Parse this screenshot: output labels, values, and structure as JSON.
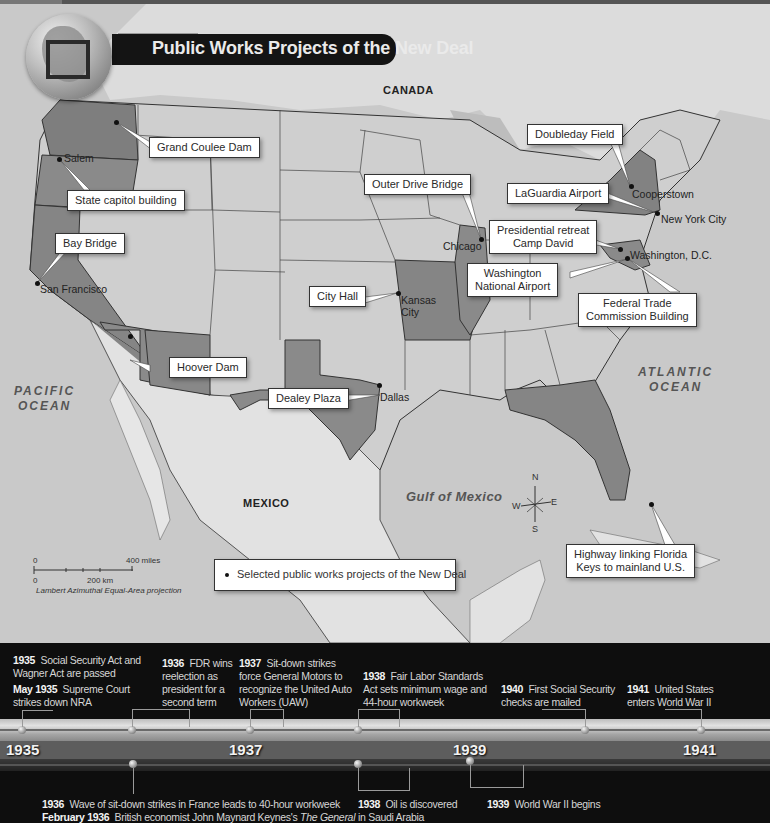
{
  "title": "Public Works Projects of the New Deal",
  "regions": {
    "canada": "CANADA",
    "mexico": "MEXICO",
    "pacific_ocean": [
      "PACIFIC",
      "OCEAN"
    ],
    "atlantic_ocean": [
      "ATLANTIC",
      "OCEAN"
    ],
    "gulf": "Gulf of Mexico"
  },
  "cities": [
    {
      "name": "Salem",
      "x": 40,
      "y": 157
    },
    {
      "name": "San Francisco",
      "x": 37,
      "y": 282
    },
    {
      "name": "Chicago",
      "x": 474,
      "y": 239
    },
    {
      "name": "Kansas City",
      "x": 398,
      "y": 292
    },
    {
      "name": "Dallas",
      "x": 658,
      "y": 0
    },
    {
      "name": "Cooperstown",
      "x": 632,
      "y": 186
    },
    {
      "name": "New York City",
      "x": 660,
      "y": 212
    },
    {
      "name": "Washington, D.C.",
      "x": 630,
      "y": 250
    }
  ],
  "labels": {
    "grand_coulee": "Grand Coulee Dam",
    "state_capitol": "State capitol building",
    "bay_bridge": "Bay Bridge",
    "hoover_dam": "Hoover Dam",
    "dealey_plaza": "Dealey Plaza",
    "city_hall": "City Hall",
    "outer_drive": "Outer Drive Bridge",
    "doubleday": "Doubleday Field",
    "laguardia": "LaGuardia Airport",
    "camp_david": [
      "Presidential retreat",
      "Camp David"
    ],
    "wash_airport": [
      "Washington",
      "National Airport"
    ],
    "ftc": [
      "Federal Trade",
      "Commission Building"
    ],
    "highway_keys": [
      "Highway linking Florida",
      "Keys to mainland U.S."
    ]
  },
  "city_names": {
    "salem": "Salem",
    "san_francisco": "San Francisco",
    "chicago": "Chicago",
    "kansas_city": [
      "Kansas",
      "City"
    ],
    "dallas": "Dallas",
    "cooperstown": "Cooperstown",
    "nyc": "New York City",
    "dc": "Washington, D.C."
  },
  "legend": {
    "text": "Selected public works projects of the New Deal"
  },
  "scale": {
    "zero_top": "0",
    "miles": "400 miles",
    "zero_bottom": "0",
    "km": "200 km",
    "projection": "Lambert Azimuthal Equal-Area projection"
  },
  "compass": {
    "n": "N",
    "s": "S",
    "e": "E",
    "w": "W"
  },
  "timeline": {
    "years": [
      "1935",
      "1937",
      "1939",
      "1941"
    ],
    "above": [
      {
        "year": "1935",
        "text": "Social Security Act and",
        "text2": "Wagner Act are passed"
      },
      {
        "year": "May 1935",
        "text": "Supreme Court",
        "text2": "strikes down NRA"
      },
      {
        "year": "1936",
        "text": "FDR wins",
        "lines": [
          "reelection as",
          "president for a",
          "second term"
        ]
      },
      {
        "year": "1937",
        "text": "Sit-down strikes",
        "lines": [
          "force General Motors to",
          "recognize the United Auto",
          "Workers (UAW)"
        ]
      },
      {
        "year": "1938",
        "text": "Fair Labor Standards",
        "lines": [
          "Act sets minimum wage and",
          "44-hour workweek"
        ]
      },
      {
        "year": "1940",
        "text": "First Social Security",
        "lines": [
          "checks are mailed"
        ]
      },
      {
        "year": "1941",
        "text": "United States",
        "lines": [
          "enters World War II"
        ]
      }
    ],
    "below": [
      {
        "year": "1936",
        "text": "Wave of sit-down strikes in France leads to 40-hour workweek"
      },
      {
        "year": "February 1936",
        "text": "British economist John Maynard Keynes's",
        "italic": "The General"
      },
      {
        "year": "1938",
        "text": "Oil is discovered",
        "text2": "in Saudi Arabia"
      },
      {
        "year": "1939",
        "text": "World War II begins"
      }
    ]
  }
}
